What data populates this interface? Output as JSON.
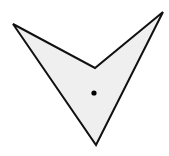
{
  "diagram": {
    "shape": {
      "type": "concave-quadrilateral",
      "vertices": [
        {
          "name": "left-tip",
          "x": 13,
          "y": 24
        },
        {
          "name": "inner-notch",
          "x": 95,
          "y": 68
        },
        {
          "name": "right-tip",
          "x": 163,
          "y": 12
        },
        {
          "name": "bottom-tip",
          "x": 96,
          "y": 145
        }
      ],
      "fill": "#efefef",
      "stroke": "#111111",
      "stroke_width": 2
    },
    "point": {
      "x": 94,
      "y": 93,
      "radius": 2.6,
      "color": "#000000"
    },
    "background": "#ffffff"
  }
}
